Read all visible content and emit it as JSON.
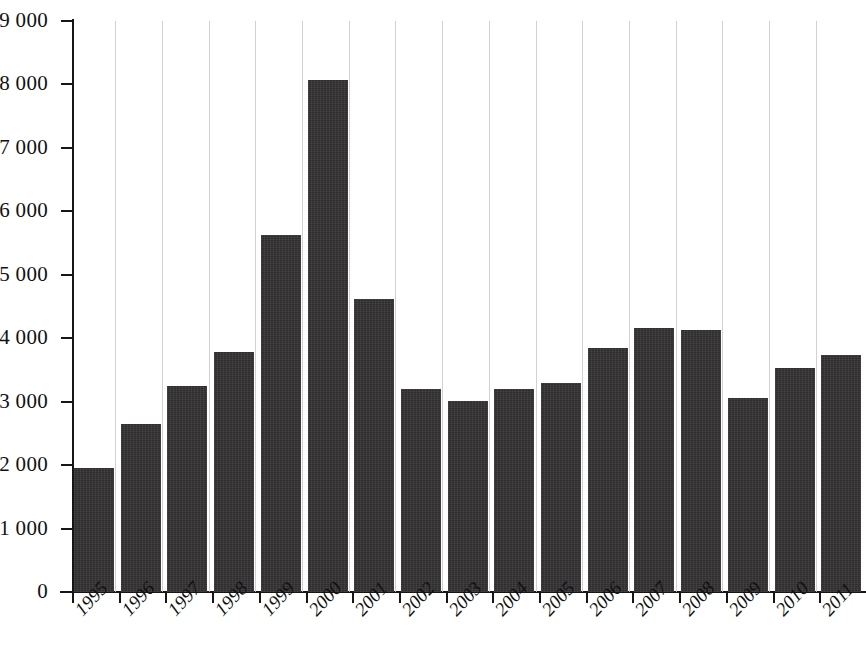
{
  "chart_data": {
    "type": "bar",
    "title": "",
    "subtitle": "",
    "xlabel": "",
    "ylabel": "",
    "categories": [
      "1995",
      "1996",
      "1997",
      "1998",
      "1999",
      "2000",
      "2001",
      "2002",
      "2003",
      "2004",
      "2005",
      "2006",
      "2007",
      "2008",
      "2009",
      "2010",
      "2011"
    ],
    "values": [
      1960,
      2650,
      3250,
      3790,
      5630,
      8070,
      4620,
      3200,
      3010,
      3200,
      3290,
      3850,
      4160,
      4130,
      3060,
      3530,
      3740
    ],
    "ylim": [
      0,
      9000
    ],
    "ytick_values": [
      0,
      1000,
      2000,
      3000,
      4000,
      5000,
      6000,
      7000,
      8000,
      9000
    ],
    "ytick_labels": [
      "0",
      "1 000",
      "2 000",
      "3 000",
      "4 000",
      "5 000",
      "6 000",
      "7 000",
      "8 000",
      "9 000"
    ],
    "grid": "vertical-only",
    "legend": "none",
    "bar_color": "#333132",
    "axis_color": "#161616",
    "gridline_color": "#c9c9c9",
    "background_color": "#ffffff"
  }
}
